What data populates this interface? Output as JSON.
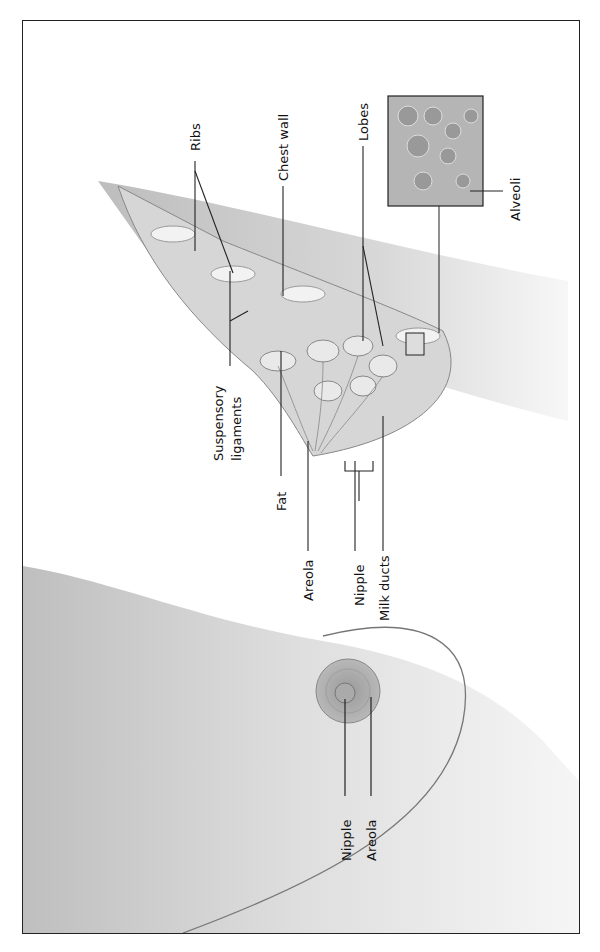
{
  "figure": {
    "side_view_labels": {
      "ribs": "Ribs",
      "chest_wall": "Chest wall",
      "lobes": "Lobes",
      "alveoli": "Alveoli",
      "suspensory_line1": "Suspensory",
      "suspensory_line2": "ligaments",
      "fat": "Fat",
      "areola": "Areola",
      "nipple": "Nipple",
      "milk_ducts": "Milk ducts"
    },
    "front_view_labels": {
      "nipple": "Nipple",
      "areola": "Areola"
    }
  },
  "colors": {
    "tissue": "#cfcfcf",
    "tissue_dark": "#a9a9a9",
    "skin": "#bdbdbd",
    "line": "#222222"
  }
}
